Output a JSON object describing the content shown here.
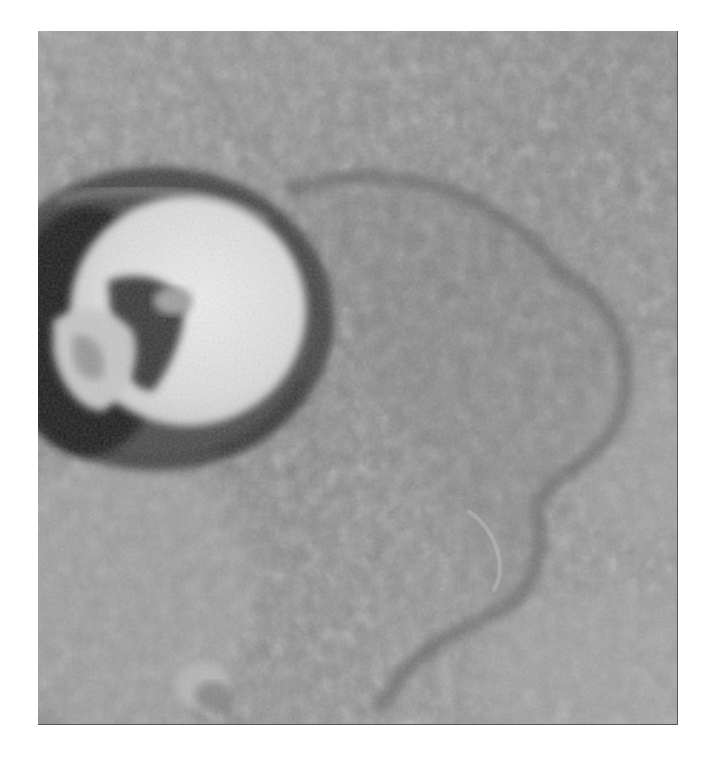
{
  "image": {
    "subject": "grayscale orbital photograph of a planetary surface with a large impact crater and lobate ejecta",
    "frame": {
      "left": 38,
      "top": 31,
      "width": 639,
      "height": 693
    },
    "colors": {
      "page_background": "#ffffff",
      "terrain_mid": "#8e8e8e",
      "terrain_dark": "#5e5e5e",
      "terrain_light": "#b4b4b4",
      "crater_floor_bright": "#e6e6e6",
      "crater_shadow": "#2a2a2a",
      "frame_edge": "#555555"
    },
    "features": [
      {
        "name": "main-crater",
        "cx": 120,
        "cy": 290,
        "rx": 165,
        "ry": 140
      },
      {
        "name": "central-peak-block",
        "cx": 70,
        "cy": 320
      },
      {
        "name": "ejecta-lobe-outline",
        "description": "dark lobate boundary curving around right side"
      },
      {
        "name": "small-hill",
        "cx": 165,
        "cy": 655
      }
    ]
  }
}
